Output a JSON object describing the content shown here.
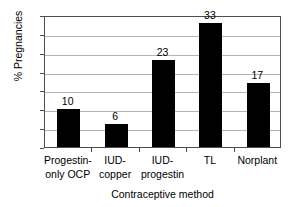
{
  "chart_data": {
    "type": "bar",
    "title": "",
    "xlabel": "Contraceptive method",
    "ylabel": "% Pregnancies",
    "categories": [
      "Progestin-only OCP",
      "IUD-copper",
      "IUD-progestin",
      "TL",
      "Norplant"
    ],
    "category_lines": [
      [
        "Progestin-",
        "only OCP"
      ],
      [
        "IUD-",
        "copper"
      ],
      [
        "IUD-",
        "progestin"
      ],
      [
        "TL"
      ],
      [
        "Norplant"
      ]
    ],
    "values": [
      10,
      6,
      23,
      33,
      17
    ],
    "value_labels": [
      "10",
      "6",
      "23",
      "33",
      "17"
    ],
    "ylim": [
      0,
      35
    ],
    "yticks": [
      0,
      5,
      10,
      15,
      20,
      25,
      30,
      35
    ],
    "ytick_labels": [
      "0",
      "5",
      "10",
      "15",
      "20",
      "25",
      "30",
      "35"
    ],
    "grid": true,
    "grid_axis": "y",
    "legend": false,
    "bar_color": "#000000",
    "grid_color": "#b3b3b3",
    "axis_color": "#4d4d4d",
    "background_color": "#ffffff"
  }
}
